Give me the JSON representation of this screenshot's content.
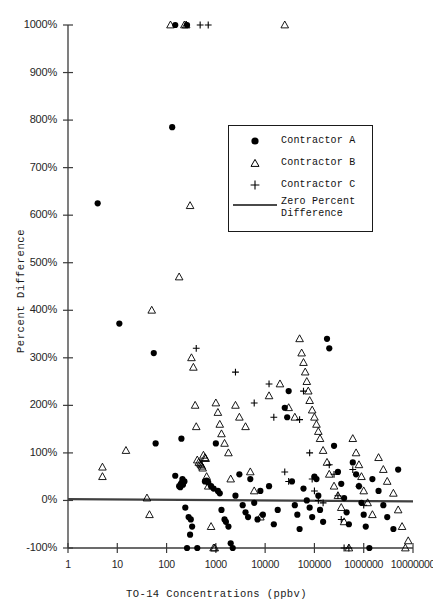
{
  "chart_data": {
    "type": "scatter",
    "title": "",
    "xlabel": "TO-14 Concentrations (ppbv)",
    "ylabel": "Percent Difference",
    "xscale": "log",
    "xlim": [
      1,
      10000000
    ],
    "ylim": [
      -100,
      1000
    ],
    "grid": false,
    "legend_position": "upper-right-inside",
    "x_ticks": [
      {
        "value": 1,
        "label": "1"
      },
      {
        "value": 10,
        "label": "10"
      },
      {
        "value": 100,
        "label": "100"
      },
      {
        "value": 1000,
        "label": "1000"
      },
      {
        "value": 10000,
        "label": "10000"
      },
      {
        "value": 100000,
        "label": "100000"
      },
      {
        "value": 1000000,
        "label": "1000000"
      },
      {
        "value": 10000000,
        "label": "10000000"
      }
    ],
    "y_ticks": [
      {
        "value": 1000,
        "label": "1000%"
      },
      {
        "value": 900,
        "label": "900%"
      },
      {
        "value": 800,
        "label": "800%"
      },
      {
        "value": 700,
        "label": "700%"
      },
      {
        "value": 600,
        "label": "600%"
      },
      {
        "value": 500,
        "label": "500%"
      },
      {
        "value": 400,
        "label": "400%"
      },
      {
        "value": 300,
        "label": "300%"
      },
      {
        "value": 200,
        "label": "200%"
      },
      {
        "value": 100,
        "label": "100%"
      },
      {
        "value": 0,
        "label": "0%"
      },
      {
        "value": -100,
        "label": "-100%"
      }
    ],
    "reference_line": {
      "y": 0,
      "label": "Zero Percent Difference",
      "color": "#404040"
    },
    "series": [
      {
        "name": "Contractor A",
        "marker": "filled-circle",
        "color": "#000000",
        "points": [
          [
            4,
            625
          ],
          [
            11,
            372
          ],
          [
            55,
            310
          ],
          [
            60,
            120
          ],
          [
            130,
            785
          ],
          [
            150,
            1000
          ],
          [
            200,
            130
          ],
          [
            260,
            1000
          ],
          [
            210,
            45
          ],
          [
            180,
            30
          ],
          [
            150,
            52
          ],
          [
            230,
            40
          ],
          [
            195,
            35
          ],
          [
            205,
            38
          ],
          [
            215,
            33
          ],
          [
            190,
            28
          ],
          [
            240,
            -15
          ],
          [
            280,
            -35
          ],
          [
            310,
            -40
          ],
          [
            330,
            -55
          ],
          [
            300,
            -72
          ],
          [
            260,
            -100
          ],
          [
            420,
            -100
          ],
          [
            600,
            40
          ],
          [
            650,
            42
          ],
          [
            700,
            38
          ],
          [
            800,
            30
          ],
          [
            900,
            25
          ],
          [
            1000,
            120
          ],
          [
            1100,
            20
          ],
          [
            1200,
            15
          ],
          [
            1300,
            -20
          ],
          [
            1500,
            -40
          ],
          [
            1600,
            -45
          ],
          [
            1800,
            -55
          ],
          [
            2000,
            -90
          ],
          [
            2200,
            -100
          ],
          [
            2500,
            10
          ],
          [
            3000,
            55
          ],
          [
            3500,
            -10
          ],
          [
            4000,
            -25
          ],
          [
            4500,
            -35
          ],
          [
            5000,
            45
          ],
          [
            6000,
            -5
          ],
          [
            7000,
            -40
          ],
          [
            8000,
            20
          ],
          [
            9000,
            -30
          ],
          [
            12000,
            30
          ],
          [
            15000,
            -50
          ],
          [
            18000,
            -20
          ],
          [
            25000,
            195
          ],
          [
            28000,
            175
          ],
          [
            30000,
            230
          ],
          [
            35000,
            40
          ],
          [
            40000,
            -10
          ],
          [
            45000,
            -30
          ],
          [
            50000,
            -60
          ],
          [
            60000,
            25
          ],
          [
            70000,
            0
          ],
          [
            80000,
            -15
          ],
          [
            90000,
            -35
          ],
          [
            100000,
            50
          ],
          [
            110000,
            45
          ],
          [
            120000,
            10
          ],
          [
            130000,
            -20
          ],
          [
            150000,
            -45
          ],
          [
            180000,
            340
          ],
          [
            200000,
            320
          ],
          [
            250000,
            115
          ],
          [
            300000,
            60
          ],
          [
            350000,
            35
          ],
          [
            400000,
            5
          ],
          [
            450000,
            -25
          ],
          [
            500000,
            -50
          ],
          [
            600000,
            80
          ],
          [
            700000,
            55
          ],
          [
            800000,
            30
          ],
          [
            900000,
            -5
          ],
          [
            1000000,
            -30
          ],
          [
            1100000,
            -55
          ],
          [
            1300000,
            -100
          ],
          [
            1500000,
            45
          ],
          [
            2000000,
            20
          ],
          [
            2500000,
            -10
          ],
          [
            3000000,
            -35
          ],
          [
            4000000,
            -60
          ],
          [
            5000000,
            65
          ]
        ]
      },
      {
        "name": "Contractor B",
        "marker": "open-triangle",
        "color": "#000000",
        "points": [
          [
            5,
            70
          ],
          [
            5,
            50
          ],
          [
            15,
            105
          ],
          [
            40,
            5
          ],
          [
            45,
            -30
          ],
          [
            50,
            400
          ],
          [
            120,
            1000
          ],
          [
            230,
            1000
          ],
          [
            250,
            1000
          ],
          [
            180,
            470
          ],
          [
            300,
            620
          ],
          [
            320,
            300
          ],
          [
            350,
            280
          ],
          [
            380,
            200
          ],
          [
            400,
            155
          ],
          [
            420,
            85
          ],
          [
            450,
            80
          ],
          [
            480,
            78
          ],
          [
            500,
            75
          ],
          [
            520,
            72
          ],
          [
            540,
            68
          ],
          [
            560,
            95
          ],
          [
            600,
            90
          ],
          [
            620,
            88
          ],
          [
            650,
            50
          ],
          [
            700,
            30
          ],
          [
            800,
            -55
          ],
          [
            900,
            -100
          ],
          [
            950,
            -100
          ],
          [
            1000,
            205
          ],
          [
            1100,
            185
          ],
          [
            1200,
            160
          ],
          [
            1300,
            140
          ],
          [
            1500,
            120
          ],
          [
            1800,
            100
          ],
          [
            2000,
            45
          ],
          [
            2500,
            200
          ],
          [
            3000,
            175
          ],
          [
            4000,
            155
          ],
          [
            5000,
            60
          ],
          [
            6000,
            20
          ],
          [
            8000,
            -35
          ],
          [
            12000,
            220
          ],
          [
            20000,
            245
          ],
          [
            25000,
            1000
          ],
          [
            30000,
            195
          ],
          [
            40000,
            175
          ],
          [
            50000,
            340
          ],
          [
            55000,
            310
          ],
          [
            60000,
            290
          ],
          [
            65000,
            270
          ],
          [
            70000,
            250
          ],
          [
            75000,
            230
          ],
          [
            80000,
            210
          ],
          [
            90000,
            190
          ],
          [
            100000,
            175
          ],
          [
            110000,
            160
          ],
          [
            120000,
            145
          ],
          [
            130000,
            130
          ],
          [
            150000,
            105
          ],
          [
            180000,
            80
          ],
          [
            200000,
            55
          ],
          [
            250000,
            30
          ],
          [
            300000,
            10
          ],
          [
            350000,
            -15
          ],
          [
            400000,
            -45
          ],
          [
            500000,
            -100
          ],
          [
            600000,
            130
          ],
          [
            700000,
            100
          ],
          [
            800000,
            75
          ],
          [
            900000,
            50
          ],
          [
            1000000,
            20
          ],
          [
            1200000,
            -5
          ],
          [
            1500000,
            -30
          ],
          [
            2000000,
            90
          ],
          [
            2500000,
            65
          ],
          [
            3000000,
            40
          ],
          [
            4000000,
            15
          ],
          [
            5000000,
            -20
          ],
          [
            6000000,
            -55
          ],
          [
            7000000,
            -100
          ],
          [
            8000000,
            -85
          ]
        ]
      },
      {
        "name": "Contractor C",
        "marker": "plus",
        "color": "#000000",
        "points": [
          [
            400,
            320
          ],
          [
            480,
            1000
          ],
          [
            700,
            1000
          ],
          [
            2500,
            270
          ],
          [
            6000,
            205
          ],
          [
            12000,
            245
          ],
          [
            15000,
            175
          ],
          [
            25000,
            60
          ],
          [
            30000,
            40
          ],
          [
            50000,
            170
          ],
          [
            60000,
            230
          ],
          [
            80000,
            100
          ],
          [
            90000,
            45
          ],
          [
            100000,
            20
          ],
          [
            120000,
            0
          ],
          [
            150000,
            -5
          ],
          [
            200000,
            75
          ],
          [
            250000,
            55
          ],
          [
            300000,
            10
          ],
          [
            350000,
            -40
          ],
          [
            400000,
            -100
          ],
          [
            500000,
            -100
          ],
          [
            600000,
            65
          ],
          [
            800000,
            30
          ],
          [
            1000000,
            -10
          ]
        ]
      }
    ]
  },
  "legend": {
    "items": [
      {
        "label": "Contractor A",
        "marker": "filled-circle"
      },
      {
        "label": "Contractor B",
        "marker": "open-triangle"
      },
      {
        "label": "Contractor C",
        "marker": "plus"
      },
      {
        "label": "Zero Percent",
        "label2": "Difference",
        "marker": "line"
      }
    ]
  },
  "axis_titles": {
    "x": "TO-14 Concentrations (ppbv)",
    "y": "Percent Difference"
  },
  "colors": {
    "marker": "#000000",
    "axis": "#3a3a3a",
    "reference_line": "#4a4a4a",
    "text": "#262626",
    "background": "#ffffff"
  }
}
